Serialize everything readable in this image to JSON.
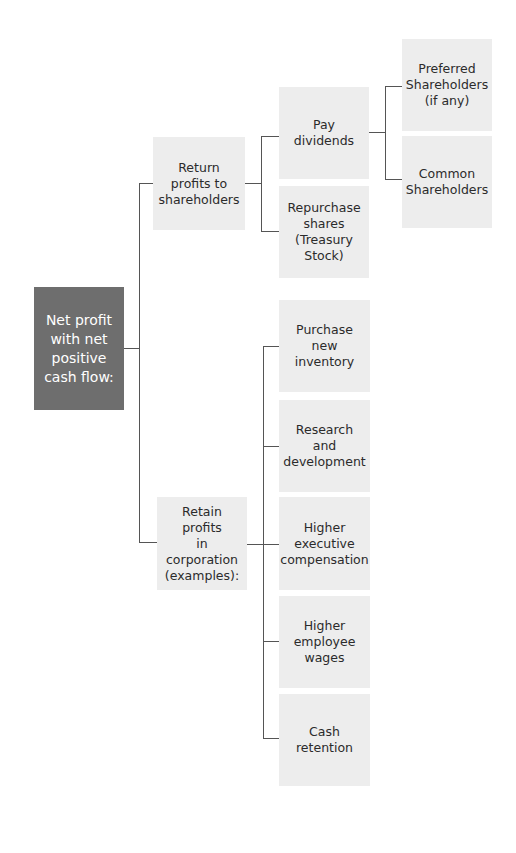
{
  "diagram": {
    "root": {
      "label": "Net profit\nwith net\npositive\ncash flow:"
    },
    "branches": [
      {
        "label": "Return\nprofits to\nshareholders",
        "children": [
          {
            "label": "Pay\ndividends",
            "children": [
              {
                "label": "Preferred\nShareholders\n(if any)"
              },
              {
                "label": "Common\nShareholders"
              }
            ]
          },
          {
            "label": "Repurchase\nshares\n(Treasury\nStock)"
          }
        ]
      },
      {
        "label": "Retain profits\nin corporation\n(examples):",
        "children": [
          {
            "label": "Purchase\nnew\ninventory"
          },
          {
            "label": "Research\nand\ndevelopment"
          },
          {
            "label": "Higher\nexecutive\ncompensation"
          },
          {
            "label": "Higher\nemployee\nwages"
          },
          {
            "label": "Cash\nretention"
          }
        ]
      }
    ]
  },
  "colors": {
    "root_fill": "#6e6e6e",
    "node_fill": "#ededed",
    "connector": "#555555",
    "text": "#2b2b2b"
  }
}
